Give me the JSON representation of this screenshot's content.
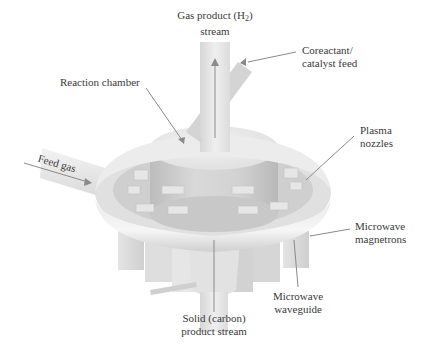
{
  "figure": {
    "type": "3d-apparatus-schematic"
  },
  "labels": {
    "gas_product": {
      "line1_prefix": "Gas product (H",
      "line1_sub": "2",
      "line1_suffix": ")",
      "line2": "stream"
    },
    "coreactant": {
      "line1": "Coreactant/",
      "line2": "catalyst feed"
    },
    "reaction_chamber": {
      "text": "Reaction chamber"
    },
    "plasma_nozzles": {
      "line1": "Plasma",
      "line2": "nozzles"
    },
    "feed_gas": {
      "text": "Feed gas"
    },
    "microwave_magnetrons": {
      "line1": "Microwave",
      "line2": "magnetrons"
    },
    "microwave_waveguide": {
      "line1": "Microwave",
      "line2": "waveguide"
    },
    "solid_product": {
      "line1": "Solid (carbon)",
      "line2": "product stream"
    }
  },
  "colors": {
    "background": "#ffffff",
    "body_light": "#f0f0f0",
    "body_mid": "#d8d8d8",
    "body_dark": "#bdbdbd",
    "leader_line": "#8a8a8a",
    "text": "#3a3a3a"
  }
}
